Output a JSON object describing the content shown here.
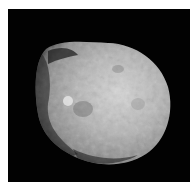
{
  "image": {
    "subject": "irregular cratered moon on black space background",
    "background_color": "#020202",
    "border_color": "#ffffff",
    "moon_colors": {
      "highlight": "#d8d8d8",
      "mid": "#a8a8a8",
      "shadow": "#3a3a3a"
    }
  }
}
